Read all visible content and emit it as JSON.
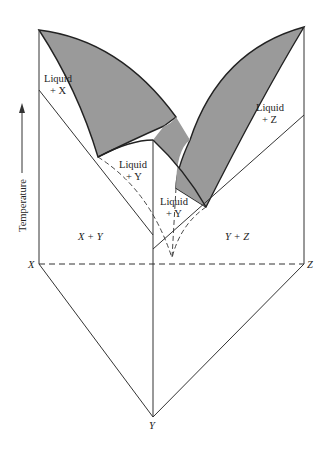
{
  "diagram": {
    "type": "ternary eutectic phase diagram (3D prism view)",
    "axis_label": "Temperature",
    "components": {
      "x": "X",
      "y": "Y",
      "z": "Z"
    },
    "regions": {
      "liquid_x": {
        "line1": "Liquid",
        "line2": "+ X"
      },
      "liquid_y_left": {
        "line1": "Liquid",
        "line2": "+ Y"
      },
      "liquid_y_center": {
        "line1": "Liquid",
        "line2": "+ Y"
      },
      "liquid_z": {
        "line1": "Liquid",
        "line2": "+ Z"
      },
      "x_plus_y": "X + Y",
      "y_plus_z": "Y + Z"
    },
    "colors": {
      "shaded": "#9a9a9a",
      "line": "#333333"
    }
  }
}
